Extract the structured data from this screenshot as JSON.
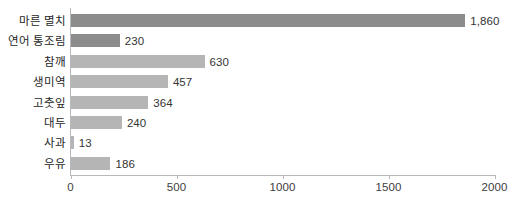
{
  "chart_data": {
    "type": "bar",
    "orientation": "horizontal",
    "title": "",
    "xlabel": "",
    "ylabel": "",
    "xlim": [
      0,
      2000
    ],
    "grid": false,
    "legend": null,
    "xticks": [
      "0",
      "500",
      "1000",
      "1500",
      "2000"
    ],
    "xtick_values": [
      0,
      500,
      1000,
      1500,
      2000
    ],
    "categories": [
      "마른 멸치",
      "연어 통조림",
      "참깨",
      "생미역",
      "고춧잎",
      "대두",
      "사과",
      "우유"
    ],
    "values": [
      1860,
      230,
      630,
      457,
      364,
      240,
      13,
      186
    ],
    "value_labels": [
      "1,860",
      "230",
      "630",
      "457",
      "364",
      "240",
      "13",
      "186"
    ],
    "bar_colors": [
      "#8c8c8c",
      "#8c8c8c",
      "#b5b5b5",
      "#b5b5b5",
      "#b5b5b5",
      "#b5b5b5",
      "#b5b5b5",
      "#b5b5b5"
    ]
  },
  "style": {
    "axis_color": "#b9b9b9",
    "text_color": "#262626",
    "value_text_color": "#333333",
    "background": "#ffffff",
    "bar_dark": "#8c8c8c",
    "bar_light": "#b5b5b5"
  }
}
